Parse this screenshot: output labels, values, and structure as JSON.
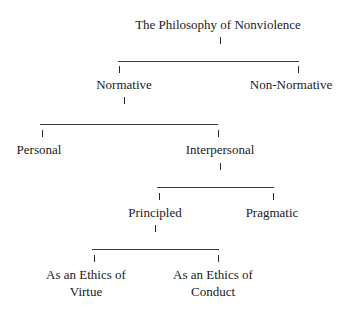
{
  "diagram": {
    "title": "The Philosophy of Nonviolence",
    "level1": {
      "left": "Normative",
      "right": "Non-Normative"
    },
    "level2": {
      "left": "Personal",
      "right": "Interpersonal"
    },
    "level3": {
      "left": "Principled",
      "right": "Pragmatic"
    },
    "level4": {
      "left_line1": "As an Ethics of",
      "left_line2": "Virtue",
      "right_line1": "As an Ethics of",
      "right_line2": "Conduct"
    },
    "colors": {
      "text": "#1a1a1a",
      "lines": "#3a3a3a",
      "background": "#ffffff"
    }
  }
}
